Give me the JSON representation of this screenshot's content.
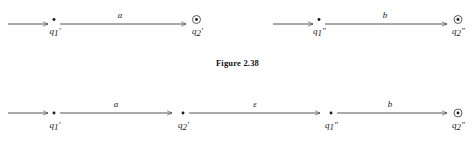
{
  "figure": {
    "caption": "Figure 2.38",
    "background_color": "#ffffff",
    "ink_color": "#1a1a1a"
  },
  "diagram_data": {
    "type": "state-diagram",
    "description": "Two rows of NFA fragments: top row shows two separate two-state machines; bottom row shows them concatenated with an epsilon transition.",
    "rows": [
      {
        "id": "row-1",
        "machines": [
          {
            "id": "machine-a",
            "start_arrow": true,
            "states": [
              {
                "name": "q1'",
                "base": "q",
                "subscript": "1",
                "prime": "′",
                "accepting": false
              },
              {
                "name": "q2'",
                "base": "q",
                "subscript": "2",
                "prime": "′",
                "accepting": true
              }
            ],
            "transitions": [
              {
                "from": "q1'",
                "to": "q2'",
                "label": "a"
              }
            ]
          },
          {
            "id": "machine-b",
            "start_arrow": true,
            "states": [
              {
                "name": "q1''",
                "base": "q",
                "subscript": "1",
                "prime": "″",
                "accepting": false
              },
              {
                "name": "q2''",
                "base": "q",
                "subscript": "2",
                "prime": "″",
                "accepting": true
              }
            ],
            "transitions": [
              {
                "from": "q1''",
                "to": "q2''",
                "label": "b"
              }
            ]
          }
        ]
      },
      {
        "id": "row-2",
        "machines": [
          {
            "id": "machine-concat",
            "start_arrow": true,
            "states": [
              {
                "name": "q1'",
                "base": "q",
                "subscript": "1",
                "prime": "′",
                "accepting": false
              },
              {
                "name": "q2'",
                "base": "q",
                "subscript": "2",
                "prime": "′",
                "accepting": false
              },
              {
                "name": "q1''",
                "base": "q",
                "subscript": "1",
                "prime": "″",
                "accepting": false
              },
              {
                "name": "q2''",
                "base": "q",
                "subscript": "2",
                "prime": "″",
                "accepting": true
              }
            ],
            "transitions": [
              {
                "from": "q1'",
                "to": "q2'",
                "label": "a"
              },
              {
                "from": "q2'",
                "to": "q1''",
                "label": "ε"
              },
              {
                "from": "q1''",
                "to": "q2''",
                "label": "b"
              }
            ]
          }
        ]
      }
    ]
  },
  "labels": {
    "r1m1": {
      "trans": "a",
      "s1_base": "q",
      "s1_sub": "1",
      "s1_prime": "′",
      "s2_base": "q",
      "s2_sub": "2",
      "s2_prime": "′"
    },
    "r1m2": {
      "trans": "b",
      "s1_base": "q",
      "s1_sub": "1",
      "s1_prime": "″",
      "s2_base": "q",
      "s2_sub": "2",
      "s2_prime": "″"
    },
    "r2": {
      "trans_a": "a",
      "trans_eps": "ε",
      "trans_b": "b",
      "s1_base": "q",
      "s1_sub": "1",
      "s1_prime": "′",
      "s2_base": "q",
      "s2_sub": "2",
      "s2_prime": "′",
      "s3_base": "q",
      "s3_sub": "1",
      "s3_prime": "″",
      "s4_base": "q",
      "s4_sub": "2",
      "s4_prime": "″"
    }
  }
}
